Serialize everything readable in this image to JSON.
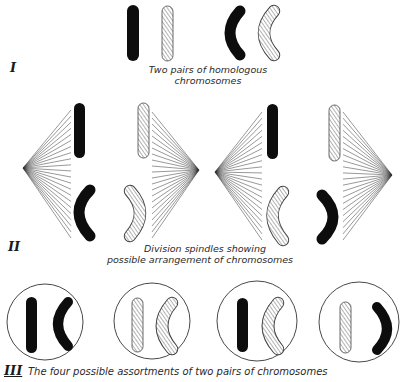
{
  "panels": {
    "panel_1": {
      "label": "I",
      "caption_line1": "Two pairs of homologous",
      "caption_line2": "chromosomes"
    },
    "panel_2": {
      "label": "II",
      "caption_line1": "Division spindles showing",
      "caption_line2": "possible arrangement of chromosomes"
    },
    "panel_3": {
      "label": "III",
      "caption": "The four possible assortments of two pairs of chromosomes"
    }
  },
  "legend": {
    "black": "solid chromosome (one parent)",
    "hatched": "hatched chromosome (other parent)",
    "colors": {
      "black": "#0d0d0d",
      "hatch": "#555555",
      "line": "#333333"
    }
  }
}
